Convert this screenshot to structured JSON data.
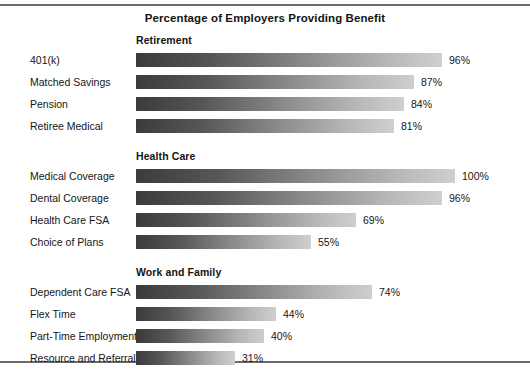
{
  "chart_data": {
    "type": "bar",
    "orientation": "horizontal",
    "title": "Percentage of Employers Providing Benefit",
    "xlabel": "",
    "ylabel": "",
    "xlim": [
      0,
      100
    ],
    "grid": false,
    "legend": "none",
    "value_suffix": "%",
    "groups": [
      {
        "name": "Retirement",
        "categories": [
          "401(k)",
          "Matched Savings",
          "Pension",
          "Retiree Medical"
        ],
        "values": [
          96,
          87,
          84,
          81
        ],
        "value_labels": [
          "96%",
          "87%",
          "84%",
          "81%"
        ]
      },
      {
        "name": "Health Care",
        "categories": [
          "Medical Coverage",
          "Dental Coverage",
          "Health Care FSA",
          "Choice of Plans"
        ],
        "values": [
          100,
          96,
          69,
          55
        ],
        "value_labels": [
          "100%",
          "96%",
          "69%",
          "55%"
        ]
      },
      {
        "name": "Work and Family",
        "categories": [
          "Dependent Care FSA",
          "Flex Time",
          "Part-Time Employment",
          "Resource and Referral"
        ],
        "values": [
          74,
          44,
          40,
          31
        ],
        "value_labels": [
          "74%",
          "44%",
          "40%",
          "31%"
        ]
      }
    ],
    "colors": {
      "bar_gradient_start": "#3b3b3b",
      "bar_gradient_end": "#cfcfcf",
      "text": "#161616",
      "frame_rule": "#6b6b6b",
      "background": "#ffffff"
    }
  }
}
